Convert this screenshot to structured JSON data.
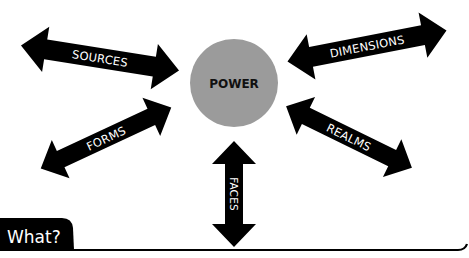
{
  "diagram": {
    "center": {
      "label": "POWER",
      "fill": "#9b9b9b",
      "text_color": "#111111"
    },
    "arrows": [
      {
        "id": "sources",
        "label": "SOURCES",
        "color": "#000000"
      },
      {
        "id": "dimensions",
        "label": "DIMENSIONS",
        "color": "#000000"
      },
      {
        "id": "forms",
        "label": "FORMS",
        "color": "#000000"
      },
      {
        "id": "realms",
        "label": "REALMS",
        "color": "#000000"
      },
      {
        "id": "faces",
        "label": "FACES",
        "color": "#000000"
      }
    ],
    "footer": {
      "tab_label": "What?",
      "tab_color": "#000000"
    }
  }
}
